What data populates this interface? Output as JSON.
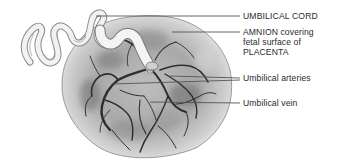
{
  "figure": {
    "labels": [
      {
        "id": "umbilical-cord",
        "text": "UMBILICAL CORD",
        "x": 243,
        "y": 12
      },
      {
        "id": "amnion",
        "lines": [
          "AMNION covering",
          "fetal surface of",
          "PLACENTA"
        ],
        "x": 243,
        "y": 28
      },
      {
        "id": "umbilical-arteries",
        "text": "Umbilical arteries",
        "x": 243,
        "y": 74
      },
      {
        "id": "umbilical-vein",
        "text": "Umbilical vein",
        "x": 243,
        "y": 98
      }
    ],
    "leader_lines": [
      {
        "label": "umbilical-cord",
        "from": [
          96,
          16
        ],
        "to": [
          240,
          16
        ]
      },
      {
        "label": "amnion",
        "from": [
          172,
          32
        ],
        "to": [
          240,
          32
        ]
      },
      {
        "label": "umbilical-arteries-1",
        "from": [
          170,
          76
        ],
        "to": [
          240,
          78
        ]
      },
      {
        "label": "umbilical-arteries-2",
        "from": [
          112,
          84
        ],
        "to": [
          240,
          80
        ]
      },
      {
        "label": "umbilical-vein",
        "from": [
          150,
          102
        ],
        "to": [
          240,
          103
        ]
      }
    ],
    "colors": {
      "background": "#ffffff",
      "text": "#2a2a2a",
      "leader": "#555555",
      "placenta_base": "#c8c8c8",
      "vessel": "#2e2e2e",
      "cord": "#f2f2f2"
    }
  }
}
